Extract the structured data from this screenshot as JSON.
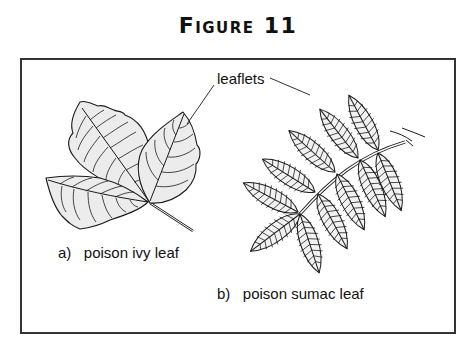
{
  "figure": {
    "title": "Figure 11",
    "callout_label": "leaflets",
    "captions": {
      "ivy": "a)   poison ivy leaf",
      "sumac": "b)   poison sumac leaf"
    },
    "colors": {
      "line": "#1a1a1a",
      "leaf_fill": "#ececec",
      "frame": "#333333"
    }
  }
}
